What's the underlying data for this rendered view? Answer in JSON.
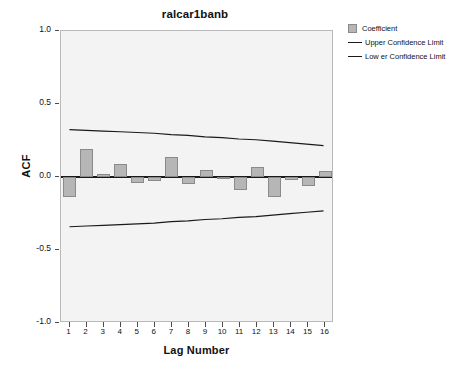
{
  "chart_data": {
    "type": "bar",
    "title": "ralcar1banb",
    "xlabel": "Lag Number",
    "ylabel": "ACF",
    "categories": [
      1,
      2,
      3,
      4,
      5,
      6,
      7,
      8,
      9,
      10,
      11,
      12,
      13,
      14,
      15,
      16
    ],
    "values": [
      -0.14,
      0.19,
      0.02,
      0.09,
      -0.04,
      -0.03,
      0.14,
      -0.05,
      0.05,
      -0.015,
      -0.09,
      0.07,
      -0.14,
      -0.02,
      -0.06,
      0.04
    ],
    "series": [
      {
        "name": "Coefficient",
        "type": "bar",
        "values": [
          -0.14,
          0.19,
          0.02,
          0.09,
          -0.04,
          -0.03,
          0.14,
          -0.05,
          0.05,
          -0.015,
          -0.09,
          0.07,
          -0.14,
          -0.02,
          -0.06,
          0.04
        ]
      },
      {
        "name": "Upper Confidence Limit",
        "type": "line",
        "values": [
          0.32,
          0.315,
          0.31,
          0.305,
          0.3,
          0.295,
          0.285,
          0.28,
          0.27,
          0.265,
          0.255,
          0.25,
          0.24,
          0.23,
          0.22,
          0.21
        ]
      },
      {
        "name": "Lower Confidence Limit",
        "type": "line",
        "values": [
          -0.35,
          -0.345,
          -0.34,
          -0.335,
          -0.33,
          -0.325,
          -0.315,
          -0.31,
          -0.3,
          -0.295,
          -0.285,
          -0.28,
          -0.27,
          -0.26,
          -0.25,
          -0.24
        ]
      }
    ],
    "ylim": [
      -1.0,
      1.0
    ],
    "yticks": [
      1.0,
      0.5,
      0.0,
      -0.5,
      -1.0
    ],
    "ytick_labels": [
      "1.0",
      "0.5",
      "0.0",
      "-0.5",
      "-1.0"
    ],
    "xticks": [
      1,
      2,
      3,
      4,
      5,
      6,
      7,
      8,
      9,
      10,
      11,
      12,
      13,
      14,
      15,
      16
    ],
    "xtick_labels": [
      "1",
      "2",
      "3",
      "4",
      "5",
      "6",
      "7",
      "8",
      "9",
      "10",
      "11",
      "12",
      "13",
      "14",
      "15",
      "16"
    ],
    "grid": false,
    "legend_position": "top-right",
    "colors": {
      "bar_fill": "#b6b6b6",
      "bar_edge": "#8a8a8a",
      "line": "#1a1a1a",
      "plot_background": "#f3f3f3",
      "plot_border": "#b9b9b9",
      "text": "#111111"
    }
  },
  "legend": {
    "items": [
      {
        "label": "Coefficient",
        "marker": "square-swatch"
      },
      {
        "label": "Upper Confidence Limit",
        "marker": "line-swatch"
      },
      {
        "label": "Low er Confidence Limit",
        "marker": "line-swatch"
      }
    ]
  }
}
